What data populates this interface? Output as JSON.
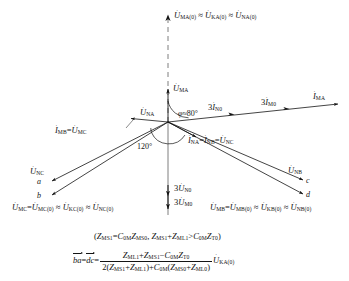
{
  "figure": {
    "type": "phasor-diagram",
    "origin": {
      "x": 168,
      "y": 122
    }
  },
  "axis": {
    "vertical_dashed": {
      "x": 168,
      "y_top": 16,
      "y_bottom": 122
    },
    "vertical_solid": {
      "x": 168,
      "y_top": 122,
      "y_bottom": 215
    }
  },
  "labels": {
    "top_reference": {
      "u_ma0": "U",
      "u_ma0_sub": "MA(0)",
      "approx1": "≈",
      "u_ka0": "U",
      "u_ka0_sub": "KA(0)",
      "approx2": "≈",
      "u_na0": "U",
      "u_na0_sub": "NA(0)"
    },
    "u_ma": {
      "symbol": "U",
      "sub": "MA"
    },
    "u_na": {
      "symbol": "U",
      "sub": "NA"
    },
    "i_ma": {
      "symbol": "I",
      "sub": "MA"
    },
    "i_n0_3": {
      "coef": "3",
      "symbol": "I",
      "sub": "N0"
    },
    "i_m0_3": {
      "coef": "3",
      "symbol": "I",
      "sub": "M0"
    },
    "i_mb_u_mc": {
      "i_symbol": "I",
      "i_sub": "MB",
      "eq": "=",
      "u_symbol": "U",
      "u_sub": "MC"
    },
    "i_na_i_nb_u_nc": {
      "i1_symbol": "I",
      "i1_sub": "NA",
      "eq1": "=",
      "i2_symbol": "I",
      "i2_sub": "NB",
      "eq2": "=",
      "u_symbol": "U",
      "u_sub": "NC"
    },
    "u_nc": {
      "symbol": "U",
      "sub": "NC"
    },
    "u_nb": {
      "symbol": "U",
      "sub": "NB"
    },
    "u_n0_3": {
      "coef": "3",
      "symbol": "U",
      "sub": "N0"
    },
    "u_m0_3": {
      "coef": "3",
      "symbol": "U",
      "sub": "M0"
    },
    "bottom_left": {
      "u1": "U",
      "u1_sub": "MC",
      "eq": "=",
      "u2": "U",
      "u2_sub": "MC(0)",
      "approx1": "≈",
      "u3": "U",
      "u3_sub": "KC(0)",
      "approx2": "≈",
      "u4": "U",
      "u4_sub": "NC(0)"
    },
    "bottom_right": {
      "u1": "U",
      "u1_sub": "MB",
      "eq": "=",
      "u2": "U",
      "u2_sub": "MB(0)",
      "approx1": "≈",
      "u3": "U",
      "u3_sub": "KB(0)",
      "approx2": "≈",
      "u4": "U",
      "u4_sub": "NB(0)"
    }
  },
  "angles": {
    "phi": {
      "symbol": "φ",
      "relation": "≈",
      "value": "80",
      "unit": "°"
    },
    "sector": {
      "value": "120",
      "unit": "°"
    }
  },
  "points": {
    "a": "a",
    "b": "b",
    "c": "c",
    "d": "d"
  },
  "condition": {
    "open": "(",
    "z_ms1": "Z",
    "z_ms1_sub": "MS1",
    "eq": "=",
    "c_0m": "C",
    "c_0m_sub": "0M",
    "z_ms0": "Z",
    "z_ms0_sub": "MS0",
    "comma": ",",
    "z_ms1b": "Z",
    "z_ms1b_sub": "MS1",
    "plus": "+",
    "z_ml1": "Z",
    "z_ml1_sub": "ML1",
    "gt": ">",
    "c_0mb": "C",
    "c_0mb_sub": "0M",
    "z_t0": "Z",
    "z_t0_sub": "T0",
    "close": ")"
  },
  "main_formula": {
    "lhs1": "ba",
    "eq1": "=",
    "lhs2": "dc",
    "eq2": "=",
    "numerator": {
      "z_ml1": "Z",
      "z_ml1_sub": "ML1",
      "plus": "+",
      "z_ms1": "Z",
      "z_ms1_sub": "MS1",
      "minus": "−",
      "c_0m": "C",
      "c_0m_sub": "0M",
      "z_t0": "Z",
      "z_t0_sub": "T0"
    },
    "denominator": {
      "two": "2(",
      "z_ms1": "Z",
      "z_ms1_sub": "MS1",
      "plus1": "+",
      "z_ml1": "Z",
      "z_ml1_sub": "ML1",
      "close1": ")",
      "plus2": "+",
      "c_0m": "C",
      "c_0m_sub": "0M",
      "open2": "(",
      "z_ms0": "Z",
      "z_ms0_sub": "MS0",
      "plus3": "+",
      "z_ml0": "Z",
      "z_ml0_sub": "ML0",
      "close2": ")"
    },
    "tail": {
      "symbol": "U",
      "sub": "KA(0)"
    }
  },
  "colors": {
    "line": "#141414",
    "text": "#141414",
    "background": "#ffffff"
  }
}
